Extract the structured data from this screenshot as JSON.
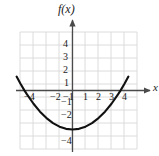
{
  "figure": {
    "title": "f(x)",
    "x_axis_label": "x",
    "background": "#ffffff",
    "grid_color": "#d8d8d8",
    "axis_color": "#4a4a4a",
    "curve_color": "#111111"
  },
  "x_tick_labels": [
    {
      "text": "−4",
      "value": -4
    },
    {
      "text": "−2",
      "value": -2
    },
    {
      "text": "−1",
      "value": -1
    },
    {
      "text": "1",
      "value": 1
    },
    {
      "text": "2",
      "value": 2
    },
    {
      "text": "3",
      "value": 3
    },
    {
      "text": "4",
      "value": 4
    }
  ],
  "y_tick_labels": [
    {
      "text": "4",
      "value": 4
    },
    {
      "text": "3",
      "value": 3
    },
    {
      "text": "2",
      "value": 2
    },
    {
      "text": "1",
      "value": 1
    },
    {
      "text": "−1",
      "value": -1
    },
    {
      "text": "−2",
      "value": -2
    },
    {
      "text": "−4",
      "value": -4
    }
  ],
  "chart_data": {
    "type": "line",
    "title": "f(x)",
    "subtitle": "",
    "xlabel": "x",
    "ylabel": "f(x)",
    "xlim": [
      -4.5,
      4.5
    ],
    "ylim": [
      -4.5,
      4.5
    ],
    "grid": true,
    "grid_step": 1,
    "legend": false,
    "legend_position": "none",
    "annotations": [],
    "series": [
      {
        "name": "f(x)",
        "function": "0.22*x^2 - 3",
        "vertex": [
          0,
          -3
        ],
        "roots": [
          -3.7,
          3.7
        ],
        "x": [
          -4.3,
          -4.0,
          -3.7,
          -3.5,
          -3.0,
          -2.5,
          -2.0,
          -1.5,
          -1.0,
          -0.5,
          0.0,
          0.5,
          1.0,
          1.5,
          2.0,
          2.5,
          3.0,
          3.5,
          3.7,
          4.0,
          4.3
        ],
        "values": [
          1.07,
          0.52,
          0.01,
          -0.3,
          -1.02,
          -1.63,
          -2.12,
          -2.51,
          -2.78,
          -2.95,
          -3.0,
          -2.95,
          -2.78,
          -2.51,
          -2.12,
          -1.63,
          -1.02,
          -0.3,
          0.01,
          0.52,
          1.07
        ]
      }
    ],
    "x_ticks": [
      -4,
      -2,
      -1,
      1,
      2,
      3,
      4
    ],
    "y_ticks": [
      4,
      3,
      2,
      1,
      -1,
      -2,
      -4
    ]
  }
}
